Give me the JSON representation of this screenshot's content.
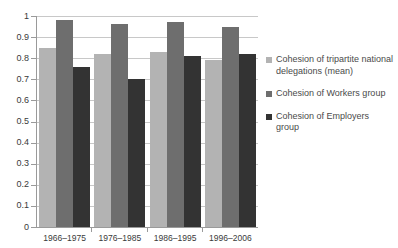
{
  "chart_data": {
    "type": "bar",
    "title": "",
    "subtitle": "",
    "xlabel": "",
    "ylabel": "",
    "ylim": [
      0,
      1
    ],
    "ytick_labels": [
      "1",
      "0.9",
      "0.8",
      "0.7",
      "0.6",
      "0.5",
      "0.4",
      "0.3",
      "0.2",
      "0.1",
      "0"
    ],
    "ytick_values": [
      1,
      0.9,
      0.8,
      0.7,
      0.6,
      0.5,
      0.4,
      0.3,
      0.2,
      0.1,
      0
    ],
    "grid": true,
    "legend_position": "right",
    "categories": [
      "1966–1975",
      "1976–1985",
      "1986–1995",
      "1996–2006"
    ],
    "series": [
      {
        "name": "Cohesion of tripartite national delegations (mean)",
        "color": "#b3b3b3",
        "values": [
          0.85,
          0.82,
          0.83,
          0.79
        ]
      },
      {
        "name": "Cohesion of Workers group",
        "color": "#6e6e6e",
        "values": [
          0.98,
          0.96,
          0.97,
          0.95
        ]
      },
      {
        "name": "Cohesion of Employers group",
        "color": "#333333",
        "values": [
          0.76,
          0.7,
          0.81,
          0.82
        ]
      }
    ]
  },
  "colors": {
    "series_1": "#b3b3b3",
    "series_2": "#6e6e6e",
    "series_3": "#333333",
    "gridline": "#c8c8c8",
    "axis": "#9a9a9a",
    "background": "#ffffff",
    "text": "#3a3a3a"
  }
}
